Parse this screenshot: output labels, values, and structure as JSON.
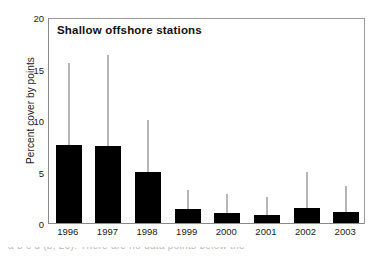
{
  "chart_data": {
    "type": "bar",
    "title": "Shallow offshore stations",
    "xlabel": "",
    "ylabel": "Percent cover by points",
    "categories": [
      "1996",
      "1997",
      "1998",
      "1999",
      "2000",
      "2001",
      "2002",
      "2003"
    ],
    "values": [
      7.6,
      7.5,
      5.0,
      1.4,
      1.0,
      0.8,
      1.5,
      1.1
    ],
    "error_upper": [
      15.5,
      16.3,
      10.0,
      3.2,
      2.8,
      2.5,
      5.0,
      3.6
    ],
    "ylim": [
      0,
      20
    ],
    "yticks": [
      0,
      5,
      10,
      15,
      20
    ],
    "ytick_labels": [
      "0",
      "5",
      "10",
      "15",
      "20"
    ],
    "grid": false,
    "legend": "none",
    "bar_color": "#000000",
    "error_color": "#6e6e6e"
  },
  "caption": {
    "fragment": "a                          b          c         d        (b, 20). There are no data points below the"
  }
}
